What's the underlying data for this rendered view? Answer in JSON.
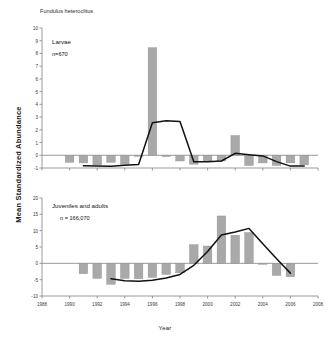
{
  "figure": {
    "species_title": "Fundulus heteroclitus",
    "y_axis_label": "Mean Standardized Abundance",
    "x_axis_label": "Year",
    "bar_color": "#a9a9a9",
    "bar_edge_color": "#8d8d8d",
    "line_color": "#111111",
    "axis_color": "#808080"
  },
  "chart_data": [
    {
      "type": "bar",
      "id": "larvae",
      "title": "Fundulus heteroclitus",
      "annotation": "Larvae",
      "annotation_n": "n=670",
      "xlabel": "",
      "ylabel": "Mean Standardized Abundance",
      "xlim": [
        1988,
        2008
      ],
      "ylim": [
        -1,
        10
      ],
      "yticks": [
        -1,
        0,
        1,
        2,
        3,
        4,
        5,
        6,
        7,
        8,
        9,
        10
      ],
      "ytick_labels": [
        "-1",
        "0",
        "1",
        "2",
        "3",
        "4",
        "5",
        "6",
        "7",
        "8",
        "9",
        "10"
      ],
      "xticks": [
        1988,
        1990,
        1992,
        1994,
        1996,
        1998,
        2000,
        2002,
        2004,
        2006,
        2008
      ],
      "xtick_labels": [
        "1988",
        "1990",
        "1992",
        "1994",
        "1996",
        "1998",
        "2000",
        "2002",
        "2004",
        "2006",
        "2008"
      ],
      "grid": false,
      "legend": "none",
      "categories": [
        1990,
        1991,
        1992,
        1993,
        1994,
        1995,
        1996,
        1997,
        1998,
        1999,
        2000,
        2001,
        2002,
        2003,
        2004,
        2005,
        2006,
        2007
      ],
      "values": [
        -0.55,
        -0.6,
        -0.75,
        -0.55,
        -0.7,
        -0.08,
        8.45,
        -0.1,
        -0.45,
        -0.7,
        -0.5,
        -0.45,
        1.55,
        -0.8,
        -0.6,
        -0.8,
        -0.6,
        -0.75
      ],
      "series": [
        {
          "name": "bars",
          "kind": "bar",
          "x": [
            1990,
            1991,
            1992,
            1993,
            1994,
            1995,
            1996,
            1997,
            1998,
            1999,
            2000,
            2001,
            2002,
            2003,
            2004,
            2005,
            2006,
            2007
          ],
          "values": [
            -0.55,
            -0.6,
            -0.75,
            -0.55,
            -0.7,
            -0.08,
            8.45,
            -0.1,
            -0.45,
            -0.7,
            -0.5,
            -0.45,
            1.55,
            -0.8,
            -0.6,
            -0.8,
            -0.6,
            -0.75
          ]
        },
        {
          "name": "trend",
          "kind": "line",
          "x": [
            1991,
            1992,
            1993,
            1994,
            1995,
            1996,
            1997,
            1998,
            1999,
            2000,
            2001,
            2002,
            2003,
            2004,
            2005,
            2006,
            2007
          ],
          "values": [
            -0.82,
            -0.84,
            -0.86,
            -0.78,
            -0.72,
            2.55,
            2.72,
            2.65,
            -0.5,
            -0.5,
            -0.45,
            0.15,
            0.05,
            -0.05,
            -0.5,
            -0.85,
            -0.85
          ]
        }
      ]
    },
    {
      "type": "bar",
      "id": "juveniles-adults",
      "title": "",
      "annotation": "Juveniles and adults",
      "annotation_n": "n = 166,070",
      "xlabel": "Year",
      "ylabel": "Mean Standardized Abundance",
      "xlim": [
        1988,
        2008
      ],
      "ylim": [
        -10,
        20
      ],
      "yticks": [
        -10,
        -5,
        0,
        5,
        10,
        15,
        20
      ],
      "ytick_labels": [
        "-10",
        "-5",
        "0",
        "5",
        "10",
        "15",
        "20"
      ],
      "xticks": [
        1988,
        1990,
        1992,
        1994,
        1996,
        1998,
        2000,
        2002,
        2004,
        2006,
        2008
      ],
      "xtick_labels": [
        "1988",
        "1990",
        "1992",
        "1994",
        "1996",
        "1998",
        "2000",
        "2002",
        "2004",
        "2006",
        "2008"
      ],
      "grid": false,
      "legend": "none",
      "categories": [
        1991,
        1992,
        1993,
        1994,
        1995,
        1996,
        1997,
        1998,
        1999,
        2000,
        2001,
        2002,
        2003,
        2004,
        2005,
        2006
      ],
      "values": [
        -3.2,
        -4.6,
        -6.4,
        -4.6,
        -4.7,
        -4.3,
        -3.4,
        -2.9,
        5.7,
        5.3,
        14.5,
        8.6,
        9.4,
        -0.3,
        -3.7,
        -4.1
      ],
      "series": [
        {
          "name": "bars",
          "kind": "bar",
          "x": [
            1991,
            1992,
            1993,
            1994,
            1995,
            1996,
            1997,
            1998,
            1999,
            2000,
            2001,
            2002,
            2003,
            2004,
            2005,
            2006
          ],
          "values": [
            -3.2,
            -4.6,
            -6.4,
            -4.6,
            -4.7,
            -4.3,
            -3.4,
            -2.9,
            5.7,
            5.3,
            14.5,
            8.6,
            9.4,
            -0.3,
            -3.7,
            -4.1
          ]
        },
        {
          "name": "trend",
          "kind": "line",
          "x": [
            1993,
            1994,
            1995,
            1996,
            1997,
            1998,
            1999,
            2000,
            2001,
            2002,
            2003,
            2004,
            2005,
            2006
          ],
          "values": [
            -4.7,
            -5.3,
            -5.5,
            -5.2,
            -4.5,
            -3.4,
            -0.6,
            3.6,
            8.7,
            9.6,
            10.7,
            6.0,
            1.4,
            -3.0
          ]
        }
      ]
    }
  ]
}
